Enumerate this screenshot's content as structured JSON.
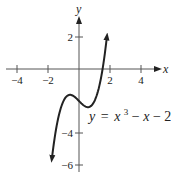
{
  "chart_data": {
    "type": "line",
    "title": "",
    "function": "y = x^3 - x - 2",
    "label": {
      "prefix": "y",
      "eq": "=",
      "x1": "x",
      "exp": "3",
      "rest": " − ",
      "x2": "x",
      "tail": " − 2"
    },
    "xlabel": "x",
    "ylabel": "y",
    "xlim": [
      -4.5,
      5
    ],
    "ylim": [
      -6.8,
      3.5
    ],
    "x_ticks": [
      {
        "value": -4,
        "label": "-4"
      },
      {
        "value": -2,
        "label": "-2"
      },
      {
        "value": 2,
        "label": "2"
      },
      {
        "value": 4,
        "label": "4"
      }
    ],
    "y_ticks": [
      {
        "value": 2,
        "label": "2"
      },
      {
        "value": -4,
        "label": "-4"
      },
      {
        "value": -6,
        "label": "-6"
      }
    ],
    "grid": false,
    "legend": null,
    "key_points": [
      {
        "x": -0.577,
        "y": -1.615,
        "note": "local max"
      },
      {
        "x": 0.577,
        "y": -2.385,
        "note": "local min"
      },
      {
        "x": 0,
        "y": -2,
        "note": "y-intercept"
      },
      {
        "x": 1.521,
        "y": 0,
        "note": "x-intercept"
      }
    ],
    "curve_domain": [
      -1.75,
      1.8
    ]
  }
}
